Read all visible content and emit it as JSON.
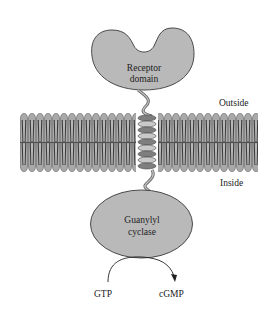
{
  "diagram": {
    "labels": {
      "receptor_line1": "Receptor",
      "receptor_line2": "domain",
      "outside": "Outside",
      "inside": "Inside",
      "enzyme_line1": "Guanylyl",
      "enzyme_line2": "cyclase",
      "substrate": "GTP",
      "product": "cGMP"
    },
    "colors": {
      "protein_fill": "#b9b9b9",
      "protein_stroke": "#4a4a4a",
      "membrane_head": "#a8a8a8",
      "membrane_tail": "#7a7a7a",
      "helix_light": "#c8c8c8",
      "helix_dark": "#808080",
      "text": "#222222"
    }
  }
}
